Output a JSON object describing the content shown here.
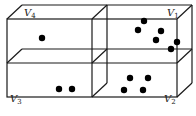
{
  "diagram": {
    "type": "3d-box-partition",
    "colors": {
      "edge": "#1a1a1a",
      "dot": "#000000",
      "background": "#ffffff"
    },
    "regions": [
      {
        "id": "V1",
        "label_main": "V",
        "label_sub": "1",
        "position": "upper-right",
        "dot_count": 6
      },
      {
        "id": "V2",
        "label_main": "V",
        "label_sub": "2",
        "position": "lower-right",
        "dot_count": 4
      },
      {
        "id": "V3",
        "label_main": "V",
        "label_sub": "3",
        "position": "lower-left",
        "dot_count": 2
      },
      {
        "id": "V4",
        "label_main": "V",
        "label_sub": "4",
        "position": "upper-left",
        "dot_count": 1
      }
    ]
  }
}
